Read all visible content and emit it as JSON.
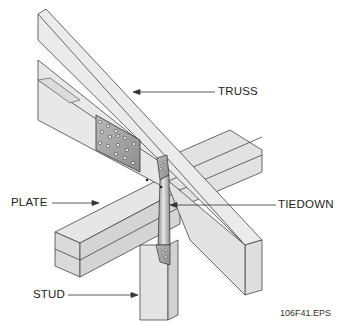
{
  "figure": {
    "labels": {
      "truss": "TRUSS",
      "plate": "PLATE",
      "tiedown": "TIEDOWN",
      "stud": "STUD"
    },
    "caption": "106F41.EPS"
  },
  "colors": {
    "wood_light": "#ececec",
    "wood_mid": "#dcdcdc",
    "wood_dark": "#c8c8c8",
    "outline": "#444444",
    "metal": "#9a9a9a",
    "metal_light": "#d0d0d0"
  }
}
